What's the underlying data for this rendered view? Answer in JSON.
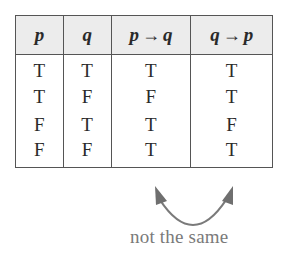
{
  "truth_table": {
    "headers": [
      {
        "left": "p",
        "arrow": "",
        "right": ""
      },
      {
        "left": "q",
        "arrow": "",
        "right": ""
      },
      {
        "left": "p",
        "arrow": "→",
        "right": "q"
      },
      {
        "left": "q",
        "arrow": "→",
        "right": "p"
      }
    ],
    "rows": [
      [
        "T",
        "T",
        "T",
        "T"
      ],
      [
        "T",
        "F",
        "F",
        "T"
      ],
      [
        "F",
        "T",
        "T",
        "F"
      ],
      [
        "F",
        "F",
        "T",
        "T"
      ]
    ]
  },
  "annotation": {
    "label": "not the same",
    "arrow_color": "#7a7a7a"
  }
}
